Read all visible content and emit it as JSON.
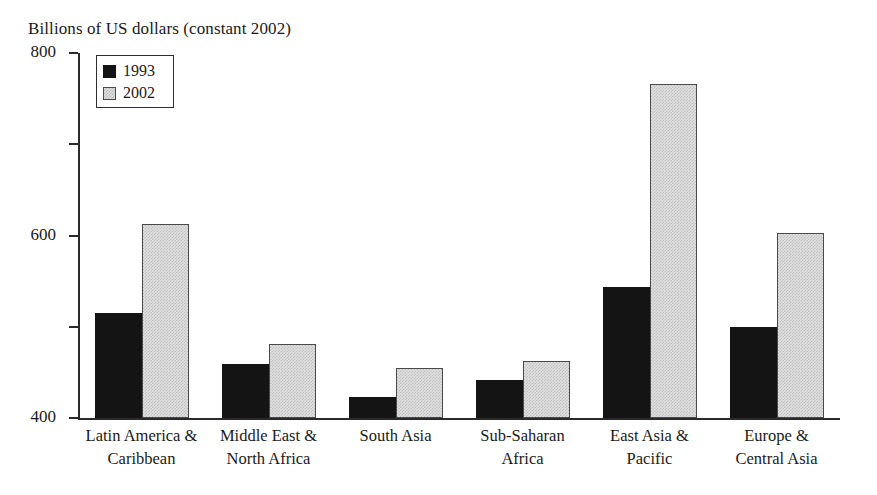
{
  "chart_data": {
    "type": "bar",
    "title": "Billions of US dollars (constant 2002)",
    "xlabel": "",
    "ylabel": "",
    "ylim": [
      0,
      800
    ],
    "yticks": [
      0,
      200,
      400,
      600,
      800
    ],
    "grid": false,
    "legend_position": "top-left",
    "categories": [
      "Latin America & Caribbean",
      "Middle East & North Africa",
      "South Asia",
      "Sub-Saharan Africa",
      "East Asia & Pacific",
      "Europe & Central Asia"
    ],
    "category_lines": [
      [
        "Latin America &",
        "Caribbean"
      ],
      [
        "Middle East &",
        "North Africa"
      ],
      [
        "South Asia",
        ""
      ],
      [
        "Sub-Saharan",
        "Africa"
      ],
      [
        "East Asia &",
        "Pacific"
      ],
      [
        "Europe &",
        "Central Asia"
      ]
    ],
    "series": [
      {
        "name": "1993",
        "color": "#141414",
        "values": [
          231,
          118,
          46,
          84,
          287,
          199
        ]
      },
      {
        "name": "2002",
        "color": "#e2e2e2",
        "values": [
          425,
          163,
          110,
          124,
          733,
          405
        ]
      }
    ]
  },
  "legend": {
    "items": [
      {
        "label": "1993"
      },
      {
        "label": "2002"
      }
    ]
  },
  "axis": {
    "tick_labels": [
      "800",
      "600",
      "400",
      "200",
      "0"
    ]
  }
}
